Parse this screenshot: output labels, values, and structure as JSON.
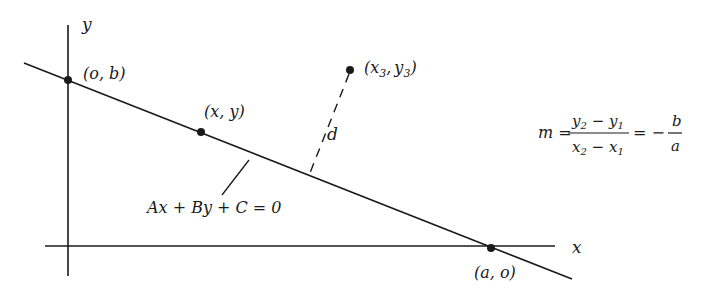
{
  "diagram": {
    "axes": {
      "x_label": "x",
      "y_label": "y"
    },
    "points": [
      {
        "id": "y-intercept",
        "label": "(o, b)"
      },
      {
        "id": "general-point",
        "label": "(x, y)"
      },
      {
        "id": "external-point",
        "label_base_x": "(x",
        "sub_x": "3",
        "comma": ",",
        "label_base_y": "y",
        "sub_y": "3",
        "close": ")"
      },
      {
        "id": "x-intercept",
        "label": "(a, o)"
      }
    ],
    "line_equation": "Ax + By + C = 0",
    "distance_label": "d",
    "slope_formula": {
      "lhs": "m =",
      "numerator": {
        "a": "y",
        "a_sub": "2",
        "op": " − ",
        "b": "y",
        "b_sub": "1"
      },
      "denominator": {
        "a": "x",
        "a_sub": "2",
        "op": " − ",
        "b": "x",
        "b_sub": "1"
      },
      "equals": "= −",
      "rhs_num": "b",
      "rhs_den": "a"
    },
    "colors": {
      "stroke": "#1a1a1a",
      "background": "#ffffff"
    }
  }
}
